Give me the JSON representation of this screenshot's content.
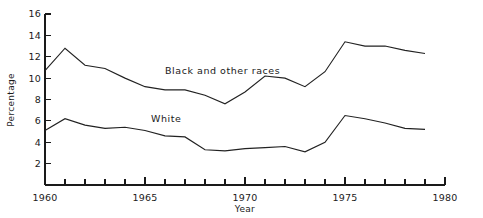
{
  "chart_data": {
    "type": "line",
    "title": "",
    "xlabel": "Year",
    "ylabel": "Percentage",
    "xlim": [
      1960,
      1980
    ],
    "ylim": [
      0,
      16
    ],
    "grid": false,
    "legend_position": "inline-annotation",
    "x_ticks_major": [
      1960,
      1965,
      1970,
      1975,
      1980
    ],
    "x_ticks_minor": [
      1961,
      1962,
      1963,
      1964,
      1966,
      1967,
      1968,
      1969,
      1971,
      1972,
      1973,
      1974,
      1976,
      1977,
      1978,
      1979
    ],
    "x_tick_labels": [
      "1960",
      "1965",
      "1970",
      "1975",
      "1980"
    ],
    "y_ticks": [
      0,
      2,
      4,
      6,
      8,
      10,
      12,
      14,
      16
    ],
    "y_tick_labels": [
      "2",
      "4",
      "6",
      "8",
      "10",
      "12",
      "14",
      "16"
    ],
    "x": [
      1960,
      1961,
      1962,
      1963,
      1964,
      1965,
      1966,
      1967,
      1968,
      1969,
      1970,
      1971,
      1972,
      1973,
      1974,
      1975,
      1976,
      1977,
      1978,
      1979
    ],
    "series": [
      {
        "name": "Black and other races",
        "label_x": 1966.0,
        "label_y": 10.4,
        "color": "#222222",
        "values": [
          10.7,
          12.8,
          11.2,
          10.9,
          10.0,
          9.2,
          8.9,
          8.9,
          8.4,
          7.6,
          8.7,
          10.2,
          10.0,
          9.2,
          10.6,
          13.4,
          13.0,
          13.0,
          12.6,
          12.3
        ]
      },
      {
        "name": "White",
        "label_x": 1965.3,
        "label_y": 5.9,
        "color": "#222222",
        "values": [
          5.1,
          6.2,
          5.6,
          5.3,
          5.4,
          5.1,
          4.6,
          4.5,
          3.3,
          3.2,
          3.4,
          3.5,
          3.6,
          3.1,
          4.0,
          6.5,
          6.2,
          5.8,
          5.3,
          5.2
        ]
      }
    ]
  },
  "axes": {
    "y_axis_title": "Percentage",
    "x_axis_title": "Year"
  },
  "annotations": {
    "black_label": "Black and other races",
    "white_label": "White"
  }
}
